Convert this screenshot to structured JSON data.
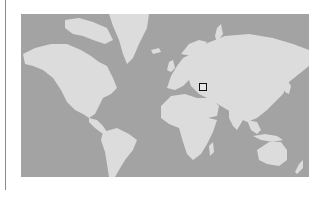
{
  "map": {
    "projection": "mercator-world",
    "colors": {
      "ocean": "#a3a3a3",
      "land": "#dcdcdc",
      "marker_border": "#111111",
      "divider": "#8a8a8a"
    },
    "marker": {
      "shape": "square",
      "region": "Iran / Caspian region",
      "icon": "location-marker-square-icon"
    }
  }
}
